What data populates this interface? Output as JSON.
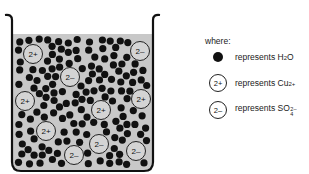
{
  "diagram": {
    "type": "particle-model",
    "beaker": {
      "liquid_color": "#c8c8c8",
      "wall_color": "#111111"
    },
    "ions_in_beaker": [
      {
        "charge": "2+",
        "x": 33,
        "y": 54
      },
      {
        "charge": "2-",
        "x": 140,
        "y": 51
      },
      {
        "charge": "2-",
        "x": 70,
        "y": 77
      },
      {
        "charge": "2+",
        "x": 25,
        "y": 101
      },
      {
        "charge": "2+",
        "x": 141,
        "y": 99
      },
      {
        "charge": "2+",
        "x": 101,
        "y": 110
      },
      {
        "charge": "2+",
        "x": 46,
        "y": 131
      },
      {
        "charge": "2-",
        "x": 99,
        "y": 144
      },
      {
        "charge": "2-",
        "x": 74,
        "y": 155
      },
      {
        "charge": "2-",
        "x": 136,
        "y": 151
      }
    ],
    "counts": {
      "Cu2+": 5,
      "SO4 2-": 5
    }
  },
  "legend": {
    "intro": "where:",
    "items": [
      {
        "symbol": "filled-dot",
        "label": "represents",
        "species_main": "H",
        "species_sub": "2",
        "species_tail": "O"
      },
      {
        "symbol": "circle",
        "symbol_text": "2+",
        "label": "represents",
        "species_main": "Cu",
        "species_sup": "2+"
      },
      {
        "symbol": "circle",
        "symbol_text": "2–",
        "label": "represents",
        "species_main": "SO",
        "species_sub": "4",
        "species_sup": "2–"
      }
    ]
  }
}
